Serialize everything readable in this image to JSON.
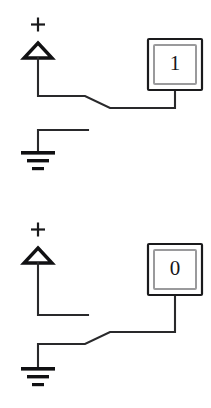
{
  "figure": {
    "background_color": "#ffffff",
    "line_color": "#29292b",
    "width": 211,
    "height": 408
  },
  "circuits": [
    {
      "id": "circuit-logic-high",
      "state_label": "1",
      "source_polarity": "+",
      "switch_position": "connected-to-source",
      "source_symbol": "triangle-voltage-source",
      "ground_symbol": "earth-ground",
      "ground_connected": false
    },
    {
      "id": "circuit-logic-low",
      "state_label": "0",
      "source_polarity": "+",
      "switch_position": "connected-to-ground",
      "source_symbol": "triangle-voltage-source",
      "ground_symbol": "earth-ground",
      "ground_connected": true
    }
  ]
}
